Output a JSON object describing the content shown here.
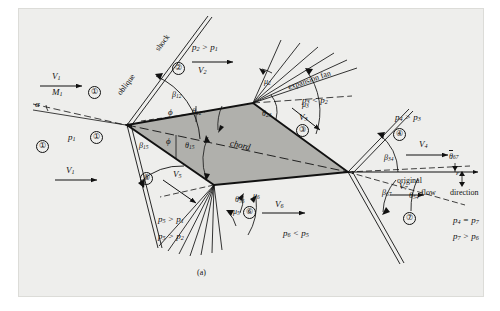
{
  "figure": {
    "caption": "(a)",
    "background_color": "#eeeeec",
    "airfoil_fill": "#b0b0ac",
    "line_color": "#111111"
  },
  "upstream": {
    "velocity_top": "V",
    "velocity_top_sub": "1",
    "mach_top": "M",
    "mach_top_sub": "1",
    "alpha": "α",
    "pressure": "p",
    "pressure_sub": "1",
    "velocity_bottom": "V",
    "velocity_bottom_sub": "1"
  },
  "features": {
    "oblique_shock_label_1": "oblique",
    "oblique_shock_label_2": "shock",
    "expansion_fan": "expansion fan",
    "chord": "chord",
    "original_flow_1": "original",
    "original_flow_2": "flow",
    "original_flow_3": "direction"
  },
  "regions": [
    {
      "id": "1",
      "glyph": "①",
      "label": "1"
    },
    {
      "id": "2",
      "glyph": "②",
      "label": "2"
    },
    {
      "id": "3",
      "glyph": "③",
      "label": "3"
    },
    {
      "id": "4",
      "glyph": "④",
      "label": "4"
    },
    {
      "id": "5",
      "glyph": "⑤",
      "label": "5"
    },
    {
      "id": "6",
      "glyph": "⑥",
      "label": "6"
    },
    {
      "id": "7",
      "glyph": "⑦",
      "label": "7"
    }
  ],
  "velocities": [
    {
      "name": "V1_top",
      "base": "V",
      "sub": "1"
    },
    {
      "name": "V1_bot",
      "base": "V",
      "sub": "1"
    },
    {
      "name": "V2",
      "base": "V",
      "sub": "2"
    },
    {
      "name": "V3",
      "base": "V",
      "sub": "3"
    },
    {
      "name": "V4",
      "base": "V",
      "sub": "4"
    },
    {
      "name": "V5",
      "base": "V",
      "sub": "5"
    },
    {
      "name": "V6",
      "base": "V",
      "sub": "6"
    },
    {
      "name": "V7",
      "base": "V",
      "sub": "7"
    }
  ],
  "pressure_relations": [
    {
      "name": "p2-gt-p1",
      "text": "p₂ > p₁",
      "base": "p",
      "sub": "2",
      "rel": ">",
      "other_base": "p",
      "other_sub": "1"
    },
    {
      "name": "p3-lt-p2",
      "text": "p₃ < p₂",
      "base": "p",
      "sub": "3",
      "rel": "<",
      "other_base": "p",
      "other_sub": "2"
    },
    {
      "name": "p4-gt-p3",
      "text": "p₄ > p₃",
      "base": "p",
      "sub": "4",
      "rel": ">",
      "other_base": "p",
      "other_sub": "3"
    },
    {
      "name": "p5-gt-p1",
      "text": "p₅ > p₁",
      "base": "p",
      "sub": "5",
      "rel": ">",
      "other_base": "p",
      "other_sub": "1"
    },
    {
      "name": "p5-gt-p2",
      "text": "p₅ > p₂",
      "base": "p",
      "sub": "5",
      "rel": ">",
      "other_base": "p",
      "other_sub": "2"
    },
    {
      "name": "p6-lt-p5",
      "text": "p₆ < p₅",
      "base": "p",
      "sub": "6",
      "rel": "<",
      "other_base": "p",
      "other_sub": "5"
    },
    {
      "name": "p4-eq-p7",
      "text": "p₄ = p₇",
      "base": "p",
      "sub": "4",
      "rel": "=",
      "other_base": "p",
      "other_sub": "7"
    },
    {
      "name": "p7-gt-p6",
      "text": "p₇ > p₆",
      "base": "p",
      "sub": "7",
      "rel": ">",
      "other_base": "p",
      "other_sub": "6"
    }
  ],
  "shock_angles": [
    {
      "name": "beta12",
      "base": "β",
      "sub": "12"
    },
    {
      "name": "beta15",
      "base": "β",
      "sub": "15"
    },
    {
      "name": "beta34",
      "base": "β",
      "sub": "34"
    },
    {
      "name": "beta67",
      "base": "β",
      "sub": "67"
    }
  ],
  "deflection_angles": [
    {
      "name": "theta12",
      "base": "θ",
      "sub": "12"
    },
    {
      "name": "theta15",
      "base": "θ",
      "sub": "15"
    },
    {
      "name": "theta23",
      "base": "θ",
      "sub": "23"
    },
    {
      "name": "theta56",
      "base": "θ",
      "sub": "56"
    },
    {
      "name": "theta54",
      "base": "θ",
      "sub": "54"
    },
    {
      "name": "theta67bar",
      "base": "θ",
      "sub": "67",
      "overbar": true
    }
  ],
  "mach_angles": [
    {
      "name": "mu2",
      "base": "μ",
      "sub": "2"
    },
    {
      "name": "mu3",
      "base": "μ",
      "sub": "3"
    },
    {
      "name": "mu5",
      "base": "μ",
      "sub": "5"
    },
    {
      "name": "mu6",
      "base": "μ",
      "sub": "6"
    }
  ],
  "wedge_angles": [
    {
      "name": "phi-upper",
      "glyph": "ϕ"
    },
    {
      "name": "phi-lower",
      "glyph": "ϕ"
    }
  ],
  "misc": {
    "epsilon": "ε",
    "alpha": "α"
  }
}
